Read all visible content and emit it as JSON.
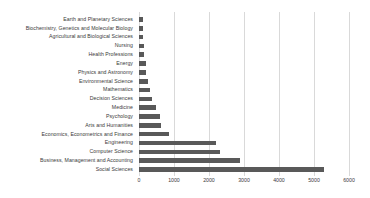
{
  "chart_data": {
    "type": "bar",
    "orientation": "horizontal",
    "title": "",
    "subtitle": "",
    "xlabel": "",
    "ylabel": "",
    "xlim": [
      0,
      6000
    ],
    "grid": true,
    "legend": null,
    "bar_color": "#595959",
    "gridline_color": "#d9d9d9",
    "xticks": [
      0,
      1000,
      2000,
      3000,
      4000,
      5000,
      6000
    ],
    "xticklabels": [
      "0",
      "1000",
      "2000",
      "3000",
      "4000",
      "5000",
      "6000"
    ],
    "categories": [
      "Earth and Planetary Sciences",
      "Biochemistry, Genetics and Molecular Biology",
      "Agricultural and Biological Sciences",
      "Nursing",
      "Health Professions",
      "Energy",
      "Physics and Astronomy",
      "Environmental Science",
      "Mathematics",
      "Decision Sciences",
      "Medicine",
      "Psychology",
      "Arts and Humanities",
      "Economics, Econometrics and Finance",
      "Engineering",
      "Computer Science",
      "Business, Management and Accounting",
      "Social Sciences"
    ],
    "values": [
      110,
      115,
      120,
      130,
      150,
      200,
      210,
      260,
      300,
      370,
      500,
      590,
      630,
      860,
      2200,
      2310,
      2880,
      5280
    ]
  }
}
